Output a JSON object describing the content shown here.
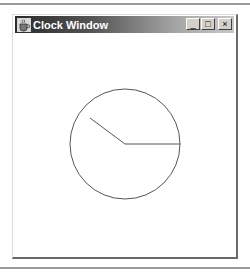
{
  "window": {
    "title": "Clock Window",
    "icon": "java-cup-icon",
    "controls": {
      "minimize": "_",
      "maximize": "□",
      "close": "×"
    }
  },
  "clock": {
    "center": [
      125,
      144
    ],
    "radius": 55,
    "stroke_color": "#555555",
    "hour_hand_end": [
      90,
      118
    ],
    "minute_hand_end": [
      180,
      144
    ]
  },
  "colors": {
    "titlebar_dark": "#2a2a2a",
    "titlebar_light": "#c8c8c8",
    "frame_shadow": "#6a6a6a"
  }
}
